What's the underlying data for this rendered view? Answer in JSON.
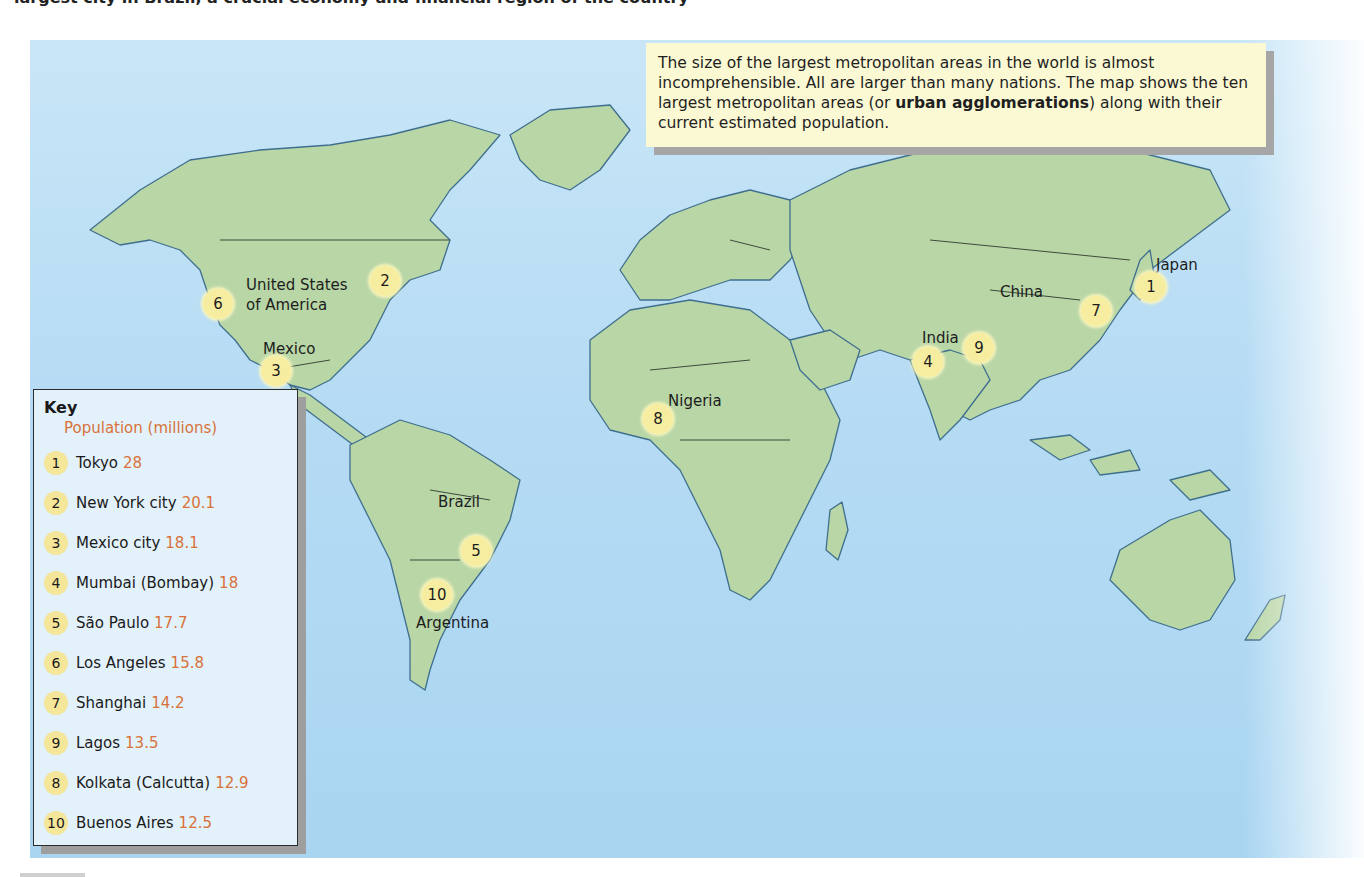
{
  "page_top_text": "largest city in Brazil, a crucial economy and financial region of the country",
  "info_box": {
    "text_before_bold": "The size of the largest metropolitan areas in the world is almost incomprehensible. All are larger than many nations. The map shows the ten largest metropolitan areas (or ",
    "bold_term": "urban agglomerations",
    "text_after_bold": ") along with their current estimated population."
  },
  "key": {
    "title": "Key",
    "subtitle": "Population (millions)",
    "entries": [
      {
        "num": "1",
        "city": "Tokyo",
        "pop": "28"
      },
      {
        "num": "2",
        "city": "New York city",
        "pop": "20.1"
      },
      {
        "num": "3",
        "city": "Mexico city",
        "pop": "18.1"
      },
      {
        "num": "4",
        "city": "Mumbai (Bombay)",
        "pop": "18"
      },
      {
        "num": "5",
        "city": "São Paulo",
        "pop": "17.7"
      },
      {
        "num": "6",
        "city": "Los Angeles",
        "pop": "15.8"
      },
      {
        "num": "7",
        "city": "Shanghai",
        "pop": "14.2"
      },
      {
        "num": "9",
        "city": "Lagos",
        "pop": "13.5"
      },
      {
        "num": "8",
        "city": "Kolkata (Calcutta)",
        "pop": "12.9"
      },
      {
        "num": "10",
        "city": "Buenos Aires",
        "pop": "12.5"
      }
    ]
  },
  "country_labels": {
    "usa_line1": "United States",
    "usa_line2": "of America",
    "mexico": "Mexico",
    "brazil": "Brazil",
    "argentina": "Argentina",
    "nigeria": "Nigeria",
    "india": "India",
    "china": "China",
    "japan": "Japan"
  },
  "markers": {
    "tokyo": "1",
    "new_york": "2",
    "mexico_city": "3",
    "mumbai": "4",
    "sao_paulo": "5",
    "los_angeles": "6",
    "shanghai": "7",
    "lagos": "8",
    "kolkata": "9",
    "buenos_aires": "10"
  },
  "colors": {
    "ocean": "#b7dcf4",
    "land": "#b9d6a7",
    "marker": "#f7eda1",
    "info_box_bg": "#fbf9d3",
    "key_bg": "#e2f1fa",
    "population_text": "#d9713a"
  }
}
